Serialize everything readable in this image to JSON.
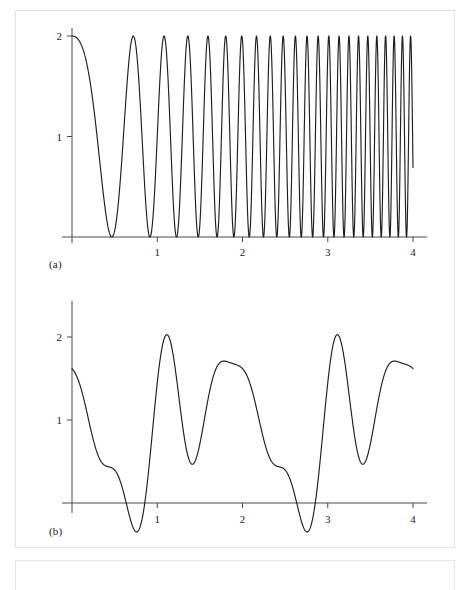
{
  "figure": {
    "background_color": "#ffffff",
    "curve_color": "#1e1e1e",
    "axis_color": "#4a4a4a",
    "panel_a_caption": "(a)",
    "panel_b_caption": "(b)"
  },
  "chart_data": [
    {
      "panel": "a",
      "type": "line",
      "title": "",
      "subtitle": "",
      "caption": "(a)",
      "xlabel": "",
      "ylabel": "",
      "xlim": [
        0,
        4.05
      ],
      "ylim": [
        0,
        2.12
      ],
      "xticks": [
        1,
        2,
        3,
        4
      ],
      "xtick_labels": [
        "1",
        "2",
        "3",
        "4"
      ],
      "yticks": [
        1,
        2
      ],
      "ytick_labels": [
        "1",
        "2"
      ],
      "grid": false,
      "legend": null,
      "legend_position": "none",
      "description": "Linear chirp envelope: amplitude-2 cosine chirp of increasing frequency, value 1 + cos(pi*k*t^2) style, starting at 2 at t=0 and oscillating between 0 and 2 with monotonically rising instantaneous frequency across 0 to 4.",
      "formula": "1 + cos(2*pi*(0.95*t + 2.55*t*t)/2)",
      "n_samples": 5200,
      "amplitude_min": 0,
      "amplitude_max": 2,
      "notable_points": [
        {
          "x": 0.0,
          "y": 2.0,
          "note": "start at maximum"
        },
        {
          "x": 0.5,
          "y": 0.0,
          "note": "first zero / minimum"
        },
        {
          "x": 0.72,
          "y": 2.0,
          "note": "second maximum"
        },
        {
          "x": 0.88,
          "y": 0.0,
          "note": "second minimum"
        },
        {
          "x": 1.02,
          "y": 2.0,
          "note": "third maximum"
        },
        {
          "x": 4.0,
          "y": 2.0,
          "note": "end near maximum, very high frequency"
        }
      ]
    },
    {
      "panel": "b",
      "type": "line",
      "title": "",
      "subtitle": "",
      "caption": "(b)",
      "xlabel": "",
      "ylabel": "",
      "xlim": [
        0,
        4.05
      ],
      "ylim": [
        -0.52,
        2.4
      ],
      "xticks": [
        1,
        2,
        3,
        4
      ],
      "xtick_labels": [
        "1",
        "2",
        "3",
        "4"
      ],
      "yticks": [
        1,
        2
      ],
      "ytick_labels": [
        "1",
        "2"
      ],
      "grid": false,
      "legend": null,
      "legend_position": "none",
      "description": "Quasi-periodic multi-tone waveform of period 2, oscillating roughly between -0.45 and 2.3, crossing zero near t = 0.49, 0.60, 1.26 (touch), 1.88, 1.96, 2.06, 2.18, 2.65 (touch), 3.44, 3.56.",
      "formula": "0.95 + 0.62*cos(2*pi*t + 1.05) + 0.52*cos(4*pi*t - 0.35) + 0.44*cos(6*pi*t + 2.1) + 0.26*cos(8*pi*t - 1.2)",
      "n_samples": 2600,
      "amplitude_min": -0.45,
      "amplitude_max": 2.3,
      "notable_points": [
        {
          "x": 0.0,
          "y": 1.78,
          "note": "start"
        },
        {
          "x": 0.13,
          "y": 2.18,
          "note": "peak 1"
        },
        {
          "x": 0.3,
          "y": 1.35,
          "note": "shoulder"
        },
        {
          "x": 0.55,
          "y": -0.45,
          "note": "deep trough 1"
        },
        {
          "x": 0.7,
          "y": 1.97,
          "note": "peak 2"
        },
        {
          "x": 0.85,
          "y": 0.58,
          "note": "trough"
        },
        {
          "x": 0.97,
          "y": 1.05,
          "note": "small peak"
        },
        {
          "x": 1.05,
          "y": 0.93,
          "note": "small dip"
        },
        {
          "x": 1.17,
          "y": 1.45,
          "note": "peak 3"
        },
        {
          "x": 1.28,
          "y": 0.05,
          "note": "near-zero dip"
        },
        {
          "x": 1.5,
          "y": 2.3,
          "note": "tallest peak"
        },
        {
          "x": 1.73,
          "y": 0.62,
          "note": "shoulder"
        },
        {
          "x": 1.92,
          "y": -0.2,
          "note": "trough"
        },
        {
          "x": 2.0,
          "y": 0.2,
          "note": "small bump at t=2"
        },
        {
          "x": 2.12,
          "y": -0.22,
          "note": "trough"
        },
        {
          "x": 2.5,
          "y": 2.3,
          "note": "tallest peak (period repeat)"
        },
        {
          "x": 2.67,
          "y": 0.06,
          "note": "near-zero dip"
        },
        {
          "x": 2.82,
          "y": 1.43,
          "note": "peak"
        },
        {
          "x": 2.98,
          "y": 0.92,
          "note": "dip"
        },
        {
          "x": 3.07,
          "y": 1.05,
          "note": "small peak"
        },
        {
          "x": 3.2,
          "y": 0.57,
          "note": "trough"
        },
        {
          "x": 3.35,
          "y": 1.96,
          "note": "peak"
        },
        {
          "x": 3.5,
          "y": -0.45,
          "note": "deep trough 2"
        },
        {
          "x": 3.88,
          "y": 2.18,
          "note": "late peak"
        },
        {
          "x": 4.0,
          "y": 1.78,
          "note": "end"
        }
      ]
    }
  ]
}
